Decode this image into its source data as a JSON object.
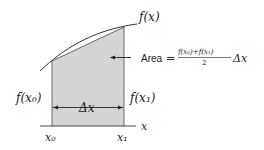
{
  "diagram": {
    "type": "trapezoid-rule-illustration",
    "labels": {
      "curve": "f(x)",
      "left_height": "f(x₀)",
      "right_height": "f(x₁)",
      "width": "Δx",
      "x_axis": "x",
      "x0": "x₀",
      "x1": "x₁",
      "area_word": "Area",
      "equals": "=",
      "numerator": "f(x₀)+f(x₁)",
      "denominator": "2",
      "delta_x": "Δx"
    },
    "colors": {
      "shade": "#d4d4d4",
      "stroke": "#333333",
      "text": "#222222"
    }
  }
}
